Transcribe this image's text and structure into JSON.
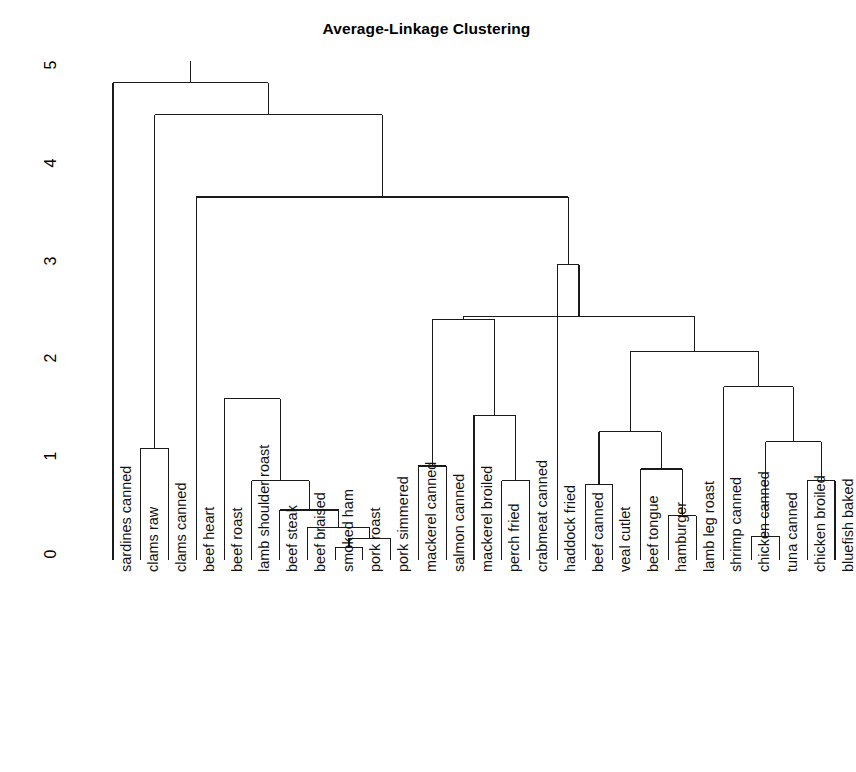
{
  "chart_data": {
    "type": "dendrogram",
    "title": "Average-Linkage Clustering",
    "xlabel": "",
    "ylabel": "",
    "ylim": [
      0,
      5.2
    ],
    "yticks": [
      0,
      1,
      2,
      3,
      4,
      5
    ],
    "ytick_labels": [
      "0",
      "1",
      "2",
      "3",
      "4",
      "5"
    ],
    "grid": false,
    "legend": "none",
    "axis_color": "#000000",
    "line_color": "#1a1a1a",
    "background": "#ffffff",
    "leaves": [
      "sardines canned",
      "clams raw",
      "clams canned",
      "beef heart",
      "beef roast",
      "lamb shoulder roast",
      "beef steak",
      "beef braised",
      "smoked ham",
      "pork roast",
      "pork simmered",
      "mackerel canned",
      "salmon canned",
      "mackerel broiled",
      "perch fried",
      "crabmeat canned",
      "haddock fried",
      "beef canned",
      "veal cutlet",
      "beef tongue",
      "hamburger",
      "lamb leg roast",
      "shrimp canned",
      "chicken canned",
      "tuna canned",
      "chicken broiled",
      "bluefish baked"
    ],
    "merges": [
      {
        "id": "m1",
        "left": "leaf:clams raw",
        "right": "leaf:clams canned",
        "height": 1.09
      },
      {
        "id": "m2",
        "left": "leaf:smoked ham",
        "right": "leaf:pork roast",
        "height": 0.08
      },
      {
        "id": "m3",
        "left": "leaf:pork simmered",
        "right": "m2",
        "height": 0.17
      },
      {
        "id": "m4",
        "left": "leaf:beef braised",
        "right": "m3",
        "height": 0.28
      },
      {
        "id": "m5",
        "left": "leaf:beef steak",
        "right": "m4",
        "height": 0.46
      },
      {
        "id": "m6",
        "left": "leaf:lamb shoulder roast",
        "right": "m5",
        "height": 0.76
      },
      {
        "id": "m7",
        "left": "leaf:beef roast",
        "right": "m6",
        "height": 1.6
      },
      {
        "id": "m8",
        "left": "leaf:mackerel canned",
        "right": "leaf:salmon canned",
        "height": 0.91
      },
      {
        "id": "m9",
        "left": "leaf:perch fried",
        "right": "leaf:crabmeat canned",
        "height": 0.76
      },
      {
        "id": "m10",
        "left": "leaf:mackerel broiled",
        "right": "m9",
        "height": 1.43
      },
      {
        "id": "m11",
        "left": "m8",
        "right": "m10",
        "height": 2.41
      },
      {
        "id": "m12",
        "left": "leaf:beef canned",
        "right": "leaf:veal cutlet",
        "height": 0.72
      },
      {
        "id": "m13",
        "left": "leaf:hamburger",
        "right": "leaf:lamb leg roast",
        "height": 0.4
      },
      {
        "id": "m14",
        "left": "leaf:beef tongue",
        "right": "m13",
        "height": 0.88
      },
      {
        "id": "m15",
        "left": "m12",
        "right": "m14",
        "height": 1.26
      },
      {
        "id": "m16",
        "left": "leaf:chicken canned",
        "right": "leaf:tuna canned",
        "height": 0.19
      },
      {
        "id": "m17",
        "left": "leaf:chicken broiled",
        "right": "leaf:bluefish baked",
        "height": 0.76
      },
      {
        "id": "m18",
        "left": "m16",
        "right": "m17",
        "height": 1.16
      },
      {
        "id": "m19",
        "left": "leaf:shrimp canned",
        "right": "m18",
        "height": 1.72
      },
      {
        "id": "m20",
        "left": "m15",
        "right": "m19",
        "height": 2.08
      },
      {
        "id": "m21",
        "left": "m11",
        "right": "m20",
        "height": 2.44
      },
      {
        "id": "m22",
        "left": "leaf:haddock fried",
        "right": "m21",
        "height": 2.97
      },
      {
        "id": "m23",
        "left": "leaf:beef heart",
        "right": "m22",
        "height": 3.66
      },
      {
        "id": "m24",
        "left": "m1",
        "right": "m23",
        "height": 4.5
      },
      {
        "id": "m25",
        "left": "leaf:sardines canned",
        "right": "m24",
        "height": 4.83
      }
    ]
  },
  "layout": {
    "plot_left": 113,
    "plot_right": 835,
    "baseline_y": 560,
    "y_zero": 555,
    "y_five": 66,
    "label_top": 572
  }
}
